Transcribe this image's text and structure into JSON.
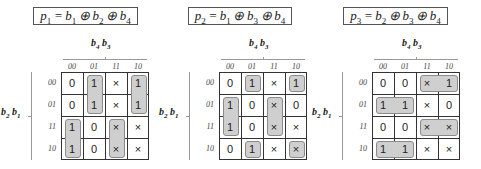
{
  "maps": [
    {
      "id": "p1",
      "equation": {
        "lhs": "p",
        "lhs_sub": "1",
        "rhs": [
          {
            "v": "b",
            "s": "1"
          },
          {
            "v": "b",
            "s": "2"
          },
          {
            "v": "b",
            "s": "4"
          }
        ],
        "op": "⊕"
      },
      "equation_text": "p1 = b1 ⊕ b2 ⊕ b4",
      "col_var_label": "b4 b3",
      "row_var_label": "b2 b1",
      "col_ticks": [
        "00",
        "01",
        "11",
        "10"
      ],
      "row_ticks": [
        "00",
        "01",
        "11",
        "10"
      ],
      "cells": [
        [
          "0",
          "1",
          "×",
          "1"
        ],
        [
          "0",
          "1",
          "×",
          "1"
        ],
        [
          "1",
          "0",
          "×",
          "×"
        ],
        [
          "1",
          "0",
          "×",
          "×"
        ]
      ],
      "groups": [
        {
          "row": 0,
          "col": 1,
          "rows": 2,
          "cols": 1
        },
        {
          "row": 0,
          "col": 3,
          "rows": 2,
          "cols": 1
        },
        {
          "row": 2,
          "col": 0,
          "rows": 2,
          "cols": 1
        },
        {
          "row": 2,
          "col": 2,
          "rows": 2,
          "cols": 1
        }
      ]
    },
    {
      "id": "p2",
      "equation_text": "p2 = b1 ⊕ b3 ⊕ b4",
      "col_var_label": "b4 b3",
      "row_var_label": "b2 b1",
      "col_ticks": [
        "00",
        "01",
        "11",
        "10"
      ],
      "row_ticks": [
        "00",
        "01",
        "11",
        "10"
      ],
      "cells": [
        [
          "0",
          "1",
          "×",
          "1"
        ],
        [
          "1",
          "0",
          "×",
          "0"
        ],
        [
          "1",
          "0",
          "×",
          "×"
        ],
        [
          "0",
          "1",
          "×",
          "×"
        ]
      ],
      "groups": [
        {
          "row": 0,
          "col": 1,
          "rows": 1,
          "cols": 1
        },
        {
          "row": 0,
          "col": 3,
          "rows": 1,
          "cols": 1
        },
        {
          "row": 1,
          "col": 0,
          "rows": 2,
          "cols": 1
        },
        {
          "row": 1,
          "col": 2,
          "rows": 2,
          "cols": 1
        },
        {
          "row": 3,
          "col": 1,
          "rows": 1,
          "cols": 1
        },
        {
          "row": 3,
          "col": 3,
          "rows": 1,
          "cols": 1
        }
      ]
    },
    {
      "id": "p3",
      "equation_text": "p3 = b2 ⊕ b3 ⊕ b4",
      "col_var_label": "b4 b3",
      "row_var_label": "b2 b1",
      "col_ticks": [
        "00",
        "01",
        "11",
        "10"
      ],
      "row_ticks": [
        "00",
        "01",
        "11",
        "10"
      ],
      "cells": [
        [
          "0",
          "0",
          "×",
          "1"
        ],
        [
          "1",
          "1",
          "×",
          "0"
        ],
        [
          "0",
          "0",
          "×",
          "×"
        ],
        [
          "1",
          "1",
          "×",
          "×"
        ]
      ],
      "groups": [
        {
          "row": 0,
          "col": 2,
          "rows": 1,
          "cols": 2
        },
        {
          "row": 1,
          "col": 0,
          "rows": 1,
          "cols": 2
        },
        {
          "row": 2,
          "col": 2,
          "rows": 1,
          "cols": 2
        },
        {
          "row": 3,
          "col": 0,
          "rows": 1,
          "cols": 2
        }
      ]
    }
  ],
  "layout": {
    "maps": [
      {
        "box_left": 33,
        "box_width": 103,
        "grid_left": 61
      },
      {
        "box_left": 188,
        "box_width": 102,
        "grid_left": 219
      },
      {
        "box_left": 343,
        "box_width": 103,
        "grid_left": 372
      }
    ],
    "cell_size": 22,
    "group_fill": "#cfcfcf",
    "group_border": "#8a8a8a"
  }
}
